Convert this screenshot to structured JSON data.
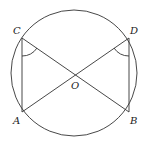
{
  "diagram": {
    "type": "circle-geometry",
    "circle": {
      "cx": 74,
      "cy": 73,
      "r": 63
    },
    "points": {
      "C": {
        "label": "C",
        "x": 22,
        "y": 38
      },
      "D": {
        "label": "D",
        "x": 129,
        "y": 38
      },
      "A": {
        "label": "A",
        "x": 22,
        "y": 112
      },
      "B": {
        "label": "B",
        "x": 129,
        "y": 112
      },
      "O": {
        "label": "O",
        "x": 76,
        "y": 74
      }
    },
    "segments": [
      "CA",
      "DB",
      "CB",
      "DA"
    ],
    "angle_marks": [
      "ACB",
      "ADB"
    ],
    "stroke_color": "#333333"
  }
}
